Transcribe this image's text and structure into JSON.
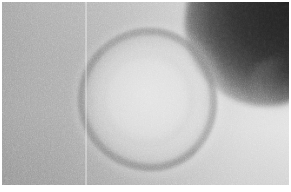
{
  "image": {
    "kind": "electron-micrograph",
    "modality": "transmission electron microscopy",
    "rendering": "grayscale",
    "width_px": 291,
    "height_px": 192,
    "caption": "",
    "scale_bar_label": "",
    "magnification_label": "",
    "annotations": []
  },
  "canvas": {
    "page_background": "#ffffff",
    "plate_left_px": 2,
    "plate_top_px": 2,
    "plate_width_px": 287,
    "plate_height_px": 183,
    "margin_top_px": 2,
    "margin_left_px": 2,
    "margin_right_px": 2,
    "margin_bottom_px": 7
  },
  "background": {
    "name": "support-film",
    "description": "smooth grainy support film, darker gray on the left grading to near-white at the right",
    "left_tone": "#9b9b9b",
    "mid_tone": "#b6b6b6",
    "right_tone": "#e1e1e1",
    "gradient_angle_deg": 100,
    "grain": "fine emulsion speckle"
  },
  "features": [
    {
      "name": "virus-particle",
      "shape": "roughly circular ring",
      "center_x_px": 145,
      "center_y_px": 97,
      "outer_diameter_px": 139,
      "core_diameter_px": 101,
      "rim_tone": "#7d7d7d",
      "core_tone": "#e8e8e8",
      "description": "large round particle with a granular darker rim and a paler, slightly mottled interior core"
    },
    {
      "name": "dark-crescent",
      "shape": "crescent / lobe",
      "position": "upper-right corner",
      "tone": "#242424",
      "description": "dense out-of-focus dark mass entering from the top-right corner and tapering downward"
    },
    {
      "name": "plate-seam",
      "shape": "thin vertical line",
      "x_px": 84,
      "tone": "#ffffff",
      "description": "faint bright vertical scratch running the full height of the plate"
    },
    {
      "name": "particle-halo",
      "shape": "diffuse ring of brightness",
      "center_x_px": 148,
      "center_y_px": 99,
      "tone": "#f2f2f2",
      "description": "pale halo of negative stain surrounding the particle"
    }
  ]
}
